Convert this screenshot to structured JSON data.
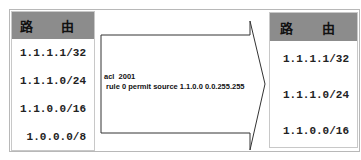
{
  "left_table": {
    "header": "路 由",
    "rows": [
      "1.1.1.1/32",
      "1.1.1.0/24",
      "1.1.0.0/16",
      "1.0.0.0/8"
    ]
  },
  "arrow": {
    "lines": [
      "acl  2001",
      " rule 0 permit source 1.1.0.0 0.0.255.255"
    ]
  },
  "right_table": {
    "header": "路 由",
    "rows": [
      "1.1.1.1/32",
      "1.1.1.0/24",
      "1.1.0.0/16"
    ]
  },
  "colors": {
    "header_bg": "#8c8c8c",
    "border": "#b8b8b8",
    "arrow_stroke": "#333333"
  }
}
